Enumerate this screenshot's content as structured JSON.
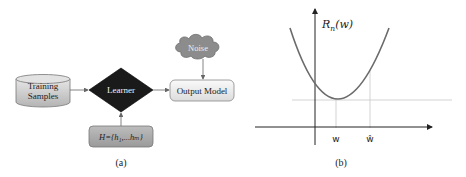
{
  "figure_a": {
    "caption": "(a)",
    "nodes": {
      "training_samples": {
        "line1": "Training",
        "line2": "Samples"
      },
      "learner": {
        "label": "Learner"
      },
      "output_model": {
        "label": "Output Model"
      },
      "noise": {
        "label": "Noise"
      },
      "hypothesis": {
        "label": "H={h₁,...hₘ}"
      }
    },
    "edges": [
      {
        "from": "Training Samples",
        "to": "Learner"
      },
      {
        "from": "Learner",
        "to": "Output Model"
      },
      {
        "from": "Noise",
        "to": "Output Model"
      },
      {
        "from": "H={h1,...hm}",
        "to": "Learner"
      }
    ],
    "colors": {
      "cylinder": "#c8c8c8",
      "learner": "#1a1a1a",
      "output_model": "#eeeeee",
      "noise": "#8c8c8c",
      "hypothesis": "#a8a8a8"
    }
  },
  "figure_b": {
    "caption": "(b)",
    "y_label": "R",
    "y_label_sub": "n",
    "y_label_arg": "(w)",
    "x_tick_1": "w",
    "x_tick_2": "ŵ",
    "colors": {
      "curve": "#6b6b6b",
      "axis": "#222222",
      "guide": "#c8c8c8"
    }
  }
}
